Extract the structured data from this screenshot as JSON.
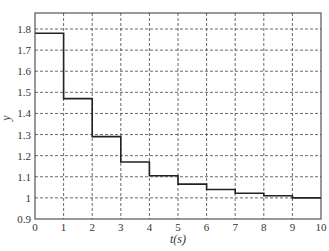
{
  "chart_data": {
    "type": "line",
    "style": "step",
    "title": "",
    "xlabel": "t(s)",
    "ylabel": "y",
    "xlim": [
      0,
      10
    ],
    "ylim": [
      0.9,
      1.85
    ],
    "grid": true,
    "x_ticks": [
      "0",
      "1",
      "2",
      "3",
      "4",
      "5",
      "6",
      "7",
      "8",
      "9",
      "10"
    ],
    "y_ticks": [
      "0.9",
      "1",
      "1.1",
      "1.2",
      "1.3",
      "1.4",
      "1.5",
      "1.6",
      "1.7",
      "1.8"
    ],
    "series": [
      {
        "name": "y",
        "x": [
          0,
          1,
          2,
          3,
          4,
          5,
          6,
          7,
          8,
          9,
          10
        ],
        "values": [
          1.78,
          1.47,
          1.29,
          1.17,
          1.105,
          1.065,
          1.04,
          1.022,
          1.01,
          1.0,
          1.0
        ]
      }
    ]
  }
}
